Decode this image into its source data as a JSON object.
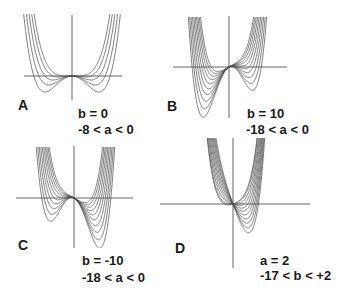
{
  "figure": {
    "colors": {
      "curve": "#4a4a4a",
      "axis": "#555555",
      "text": "#1a1a1a"
    }
  },
  "panels": [
    {
      "letter": "A",
      "line1": "b = 0",
      "line2": "-8 < a < 0"
    },
    {
      "letter": "B",
      "line1": "b = 10",
      "line2": "-18 < a < 0"
    },
    {
      "letter": "C",
      "line1": "b = -10",
      "line2": "-18 < a < 0"
    },
    {
      "letter": "D",
      "line1": "a = 2",
      "line2": "-17 < b < +2"
    }
  ],
  "chart_data": [
    {
      "type": "line",
      "title": "A",
      "function": "y = x^4 + a x^2 + b x",
      "fixed": {
        "b": 0
      },
      "varying": {
        "name": "a",
        "values": [
          -8,
          -6,
          -4,
          -2,
          0
        ]
      },
      "origin_px": [
        72,
        76
      ],
      "scale_px": [
        13.5,
        1.0
      ],
      "clip_px": {
        "x": [
          22,
          123
        ],
        "y": [
          14,
          100
        ]
      },
      "axes_px": {
        "h": [
          24,
          122
        ],
        "v": [
          15,
          100
        ]
      }
    },
    {
      "type": "line",
      "title": "B",
      "function": "y = x^4 + a x^2 + b x",
      "fixed": {
        "b": 10
      },
      "varying": {
        "name": "a",
        "values": [
          -18,
          -16,
          -14,
          -12,
          -10,
          -8,
          -6,
          -4,
          -2,
          0
        ]
      },
      "origin_px": [
        229,
        67
      ],
      "scale_px": [
        8.2,
        0.45
      ],
      "clip_px": {
        "x": [
          186,
          268
        ],
        "y": [
          17,
          118
        ]
      },
      "axes_px": {
        "h": [
          173,
          287
        ],
        "v": [
          16,
          118
        ]
      }
    },
    {
      "type": "line",
      "title": "C",
      "function": "y = x^4 + a x^2 + b x",
      "fixed": {
        "b": -10
      },
      "varying": {
        "name": "a",
        "values": [
          -18,
          -16,
          -14,
          -12,
          -10,
          -8,
          -6,
          -4,
          -2,
          0
        ]
      },
      "origin_px": [
        74,
        198
      ],
      "scale_px": [
        8.2,
        0.45
      ],
      "clip_px": {
        "x": [
          36,
          117
        ],
        "y": [
          147,
          248
        ]
      },
      "axes_px": {
        "h": [
          16,
          133
        ],
        "v": [
          146,
          248
        ]
      }
    },
    {
      "type": "line",
      "title": "D",
      "function": "y = x^4 + a x^2 + b x",
      "fixed": {
        "a": 2
      },
      "varying": {
        "name": "b",
        "values": [
          -17,
          -15,
          -13,
          -11,
          -9,
          -7,
          -5,
          -3,
          -1,
          1,
          2
        ]
      },
      "origin_px": [
        233,
        204
      ],
      "scale_px": [
        11,
        1.8
      ],
      "clip_px": {
        "x": [
          200,
          270
        ],
        "y": [
          138,
          270
        ]
      },
      "axes_px": {
        "h": [
          160,
          310
        ],
        "v": [
          138,
          268
        ]
      }
    }
  ]
}
